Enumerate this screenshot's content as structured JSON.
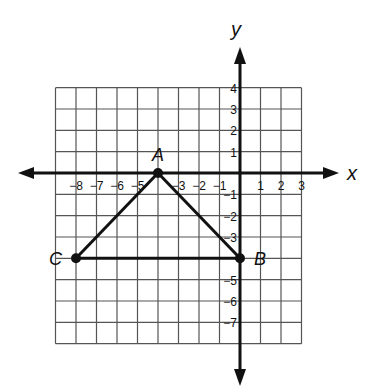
{
  "diagram": {
    "type": "coordinate-plane",
    "x_axis": {
      "label": "x",
      "min": -9,
      "max": 3,
      "tick_labels": [
        "-8",
        "-7",
        "-6",
        "-5",
        "-3",
        "-2",
        "-1",
        "1",
        "2",
        "3"
      ],
      "tick_values": [
        -8,
        -7,
        -6,
        -5,
        -3,
        -2,
        -1,
        1,
        2,
        3
      ]
    },
    "y_axis": {
      "label": "y",
      "min": -8,
      "max": 4,
      "tick_labels": [
        "4",
        "3",
        "2",
        "1",
        "-1",
        "-2",
        "-3",
        "-5",
        "-6",
        "-7"
      ],
      "tick_values": [
        4,
        3,
        2,
        1,
        -1,
        -2,
        -3,
        -5,
        -6,
        -7
      ]
    },
    "points": [
      {
        "name": "A",
        "x": -4,
        "y": 0
      },
      {
        "name": "B",
        "x": 0,
        "y": -4
      },
      {
        "name": "C",
        "x": -8,
        "y": -4
      }
    ],
    "segments": [
      [
        "A",
        "B"
      ],
      [
        "B",
        "C"
      ],
      [
        "C",
        "A"
      ]
    ],
    "shape": "triangle ABC",
    "colors": {
      "line": "#111111",
      "grid": "#555555",
      "background": "#ffffff"
    }
  }
}
